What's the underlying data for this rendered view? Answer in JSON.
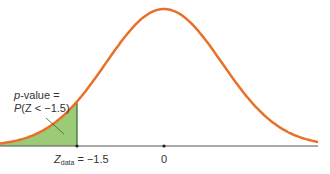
{
  "chart_data": {
    "type": "area",
    "title": "",
    "xlabel": "",
    "ylabel": "",
    "x_range": [
      -3.6,
      3.6
    ],
    "mean": 0,
    "sd": 1,
    "shaded_region": {
      "from": "-inf",
      "to": -1.5,
      "color": "#9ccb78"
    },
    "curve_color": "#e8702a",
    "tick_labels": [
      {
        "x": -1.5,
        "label_main": "Z",
        "label_sub": "data",
        "label_value": "= −1.5"
      },
      {
        "x": 0,
        "label": "0"
      }
    ],
    "annotation": {
      "line1_italic": "p",
      "line1_rest": "-value =",
      "line2_italic": "P",
      "line2_rest": "(Z < −1.5)"
    },
    "grid": false,
    "legend": null
  }
}
